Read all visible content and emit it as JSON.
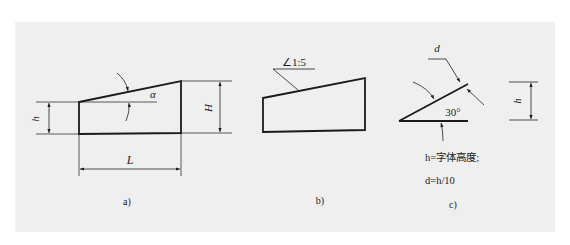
{
  "figure": {
    "panel_color": "#efefef",
    "line_color": "#1a1a1a",
    "parts": {
      "a": {
        "caption": "a)",
        "labels": {
          "height_small": "h",
          "height_large": "H",
          "length": "L",
          "angle": "α"
        }
      },
      "b": {
        "caption": "b)",
        "slope_symbol": "∠1:5"
      },
      "c": {
        "caption": "c)",
        "labels": {
          "stroke_width": "d",
          "angle": "30°",
          "height": "h"
        },
        "notes": [
          "h=字体高度;",
          "d=h/10"
        ]
      }
    }
  }
}
